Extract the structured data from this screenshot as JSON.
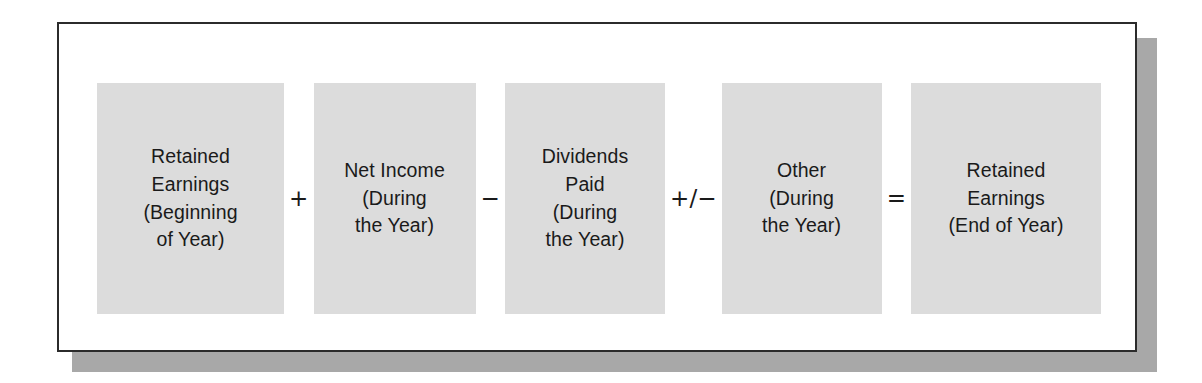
{
  "figure": {
    "type": "formula-diagram",
    "colors": {
      "box_fill": "#dcdcdc",
      "frame_border": "#2b2b2b",
      "frame_background": "#ffffff",
      "shadow": "#a8a8a8",
      "text": "#1a1a1a"
    },
    "terms": [
      {
        "id": "retained-earnings-beginning",
        "label": "Retained\nEarnings\n(Beginning\nof Year)"
      },
      {
        "id": "net-income",
        "label": "Net Income\n(During\nthe Year)"
      },
      {
        "id": "dividends-paid",
        "label": "Dividends\nPaid\n(During\nthe Year)"
      },
      {
        "id": "other",
        "label": "Other\n(During\nthe Year)"
      },
      {
        "id": "retained-earnings-end",
        "label": "Retained\nEarnings\n(End of Year)"
      }
    ],
    "operators": [
      {
        "id": "plus",
        "symbol": "+"
      },
      {
        "id": "minus",
        "symbol": "−"
      },
      {
        "id": "plus-minus",
        "symbol": "+/−"
      },
      {
        "id": "equals",
        "symbol": "="
      }
    ]
  }
}
